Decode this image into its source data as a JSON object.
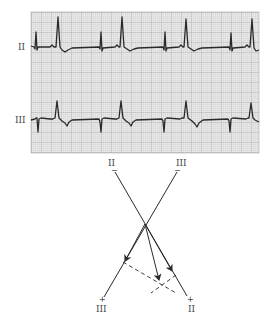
{
  "figure": {
    "type": "ECG rhythm strip with frontal-plane axis diagram",
    "grid": {
      "x": 31,
      "y": 12,
      "width": 228,
      "height": 141,
      "background": "#e9e9e9",
      "minor_line_color": "#c9c9c9",
      "major_line_color": "#9c9c9c",
      "minor_spacing": 2,
      "major_spacing": 10
    },
    "trace_color": "#2a2a2a",
    "leads": [
      {
        "name": "II",
        "label_pos": [
          20,
          49
        ],
        "baseline_y": 47,
        "beats": [
          {
            "spike_x": 36,
            "qrs_x": 58
          },
          {
            "spike_x": 101,
            "qrs_x": 122
          },
          {
            "spike_x": 165,
            "qrs_x": 186
          },
          {
            "spike_x": 231,
            "qrs_x": 252
          }
        ]
      },
      {
        "name": "III",
        "label_pos": [
          17,
          123
        ],
        "baseline_y": 119,
        "beats": [
          {
            "spike_x": 38,
            "qrs_x": 57
          },
          {
            "spike_x": 101,
            "qrs_x": 121
          },
          {
            "spike_x": 164,
            "qrs_x": 186
          },
          {
            "spike_x": 230,
            "qrs_x": 251
          }
        ]
      }
    ],
    "axis_labels_under_grid": [
      {
        "text": "II",
        "x": 111,
        "y": 166
      },
      {
        "text": "III",
        "x": 181,
        "y": 166
      }
    ],
    "vectors": {
      "lead_II": {
        "neg": [
          115,
          172
        ],
        "pos": [
          187,
          296
        ],
        "neg_label": "−",
        "pos_label": "+",
        "end_label": "II"
      },
      "lead_III": {
        "neg": [
          177,
          172
        ],
        "pos": [
          104,
          297
        ],
        "neg_label": "−",
        "pos_label": "+",
        "end_label": "III"
      },
      "crossing": [
        145,
        224
      ],
      "arrow_on_III": [
        125,
        262
      ],
      "arrow_on_II": [
        172,
        272
      ],
      "resultant_arrow": [
        159,
        281
      ],
      "dashed_lines": [
        {
          "from": [
            123,
            262
          ],
          "to": [
            176,
            293
          ]
        },
        {
          "from": [
            176,
            275
          ],
          "to": [
            151,
            293
          ]
        }
      ]
    },
    "bottom_labels": [
      {
        "text": "III",
        "x": 101,
        "y": 311
      },
      {
        "text": "II",
        "x": 190,
        "y": 311
      }
    ]
  }
}
